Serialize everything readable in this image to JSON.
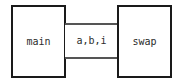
{
  "diagram": {
    "type": "module-coupling-structure-chart",
    "background_color": "#ffffff",
    "box_border_color": "#1a1a1a",
    "line_color": "#555555",
    "text_color": "#2b2b2b",
    "modules": [
      {
        "id": "main",
        "label": "main",
        "role": "caller"
      },
      {
        "id": "swap",
        "label": "swap",
        "role": "callee"
      }
    ],
    "coupling": {
      "label": "a,b,i",
      "parameters": [
        "a",
        "b",
        "i"
      ],
      "connector_count": 2
    }
  }
}
